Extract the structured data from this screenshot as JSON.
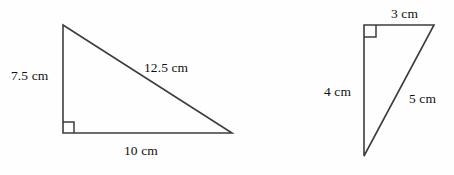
{
  "figure": {
    "type": "geometry-diagram",
    "unit": "cm",
    "stroke_color": "#3c3c3c",
    "text_color": "#111111",
    "background_color": "#fefefe",
    "triangles": [
      {
        "name": "left-triangle",
        "right_angle_vertex": "bottom-left",
        "vertices": [
          [
            63,
            25
          ],
          [
            63,
            133
          ],
          [
            232,
            133
          ]
        ],
        "labels": {
          "vertical_leg": "7.5 cm",
          "hypotenuse": "12.5 cm",
          "horizontal_leg": "10 cm"
        },
        "values": {
          "vertical_leg": 7.5,
          "hypotenuse": 12.5,
          "horizontal_leg": 10
        }
      },
      {
        "name": "right-triangle",
        "right_angle_vertex": "top-left",
        "vertices": [
          [
            364,
            25
          ],
          [
            434,
            25
          ],
          [
            364,
            156
          ]
        ],
        "labels": {
          "horizontal_leg": "3 cm",
          "vertical_leg": "4 cm",
          "hypotenuse": "5 cm"
        },
        "values": {
          "horizontal_leg": 3,
          "vertical_leg": 4,
          "hypotenuse": 5
        }
      }
    ]
  }
}
